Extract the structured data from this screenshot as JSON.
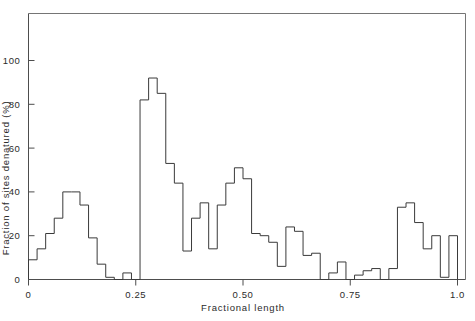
{
  "chart_data": {
    "type": "bar",
    "title": "",
    "subtitle": "",
    "xlabel": "Fractional  length",
    "ylabel": "Fraction of sites denatured (%)",
    "xlim": [
      0,
      1.0
    ],
    "ylim": [
      0,
      122
    ],
    "grid": false,
    "legend": null,
    "bin_width": 0.02,
    "xticks": [
      {
        "value": 0,
        "label": "0"
      },
      {
        "value": 0.25,
        "label": "0.25"
      },
      {
        "value": 0.5,
        "label": "0.50"
      },
      {
        "value": 0.75,
        "label": "0.75"
      },
      {
        "value": 1.0,
        "label": "1.0"
      }
    ],
    "yticks": [
      {
        "value": 0,
        "label": "0"
      },
      {
        "value": 20,
        "label": "20"
      },
      {
        "value": 40,
        "label": "40"
      },
      {
        "value": 60,
        "label": "60"
      },
      {
        "value": 80,
        "label": "80"
      },
      {
        "value": 100,
        "label": "100"
      }
    ],
    "bin_starts": [
      0.0,
      0.02,
      0.04,
      0.06,
      0.08,
      0.1,
      0.12,
      0.14,
      0.16,
      0.18,
      0.2,
      0.22,
      0.24,
      0.26,
      0.28,
      0.3,
      0.32,
      0.34,
      0.36,
      0.38,
      0.4,
      0.42,
      0.44,
      0.46,
      0.48,
      0.5,
      0.52,
      0.54,
      0.56,
      0.58,
      0.6,
      0.62,
      0.64,
      0.66,
      0.68,
      0.7,
      0.72,
      0.74,
      0.76,
      0.78,
      0.8,
      0.82,
      0.84,
      0.86,
      0.88,
      0.9,
      0.92,
      0.94,
      0.96,
      0.98
    ],
    "values": [
      9,
      14,
      21,
      28,
      40,
      40,
      34,
      19,
      7,
      1,
      0,
      3,
      0,
      82,
      92,
      85,
      53,
      44,
      13,
      28,
      35,
      14,
      34,
      44,
      51,
      46,
      21,
      20,
      17,
      6,
      24,
      22,
      11,
      12,
      0,
      3,
      8,
      0,
      2,
      4,
      5,
      0,
      5,
      33,
      35,
      26,
      14,
      20,
      1,
      20
    ],
    "categories": [
      "0.00-0.02",
      "0.02-0.04",
      "0.04-0.06",
      "0.06-0.08",
      "0.08-0.10",
      "0.10-0.12",
      "0.12-0.14",
      "0.14-0.16",
      "0.16-0.18",
      "0.18-0.20",
      "0.20-0.22",
      "0.22-0.24",
      "0.24-0.26",
      "0.26-0.28",
      "0.28-0.30",
      "0.30-0.32",
      "0.32-0.34",
      "0.34-0.36",
      "0.36-0.38",
      "0.38-0.40",
      "0.40-0.42",
      "0.42-0.44",
      "0.44-0.46",
      "0.46-0.48",
      "0.48-0.50",
      "0.50-0.52",
      "0.52-0.54",
      "0.54-0.56",
      "0.56-0.58",
      "0.58-0.60",
      "0.60-0.62",
      "0.62-0.64",
      "0.64-0.66",
      "0.66-0.68",
      "0.68-0.70",
      "0.70-0.72",
      "0.72-0.74",
      "0.74-0.76",
      "0.76-0.78",
      "0.78-0.80",
      "0.80-0.82",
      "0.82-0.84",
      "0.84-0.86",
      "0.86-0.88",
      "0.88-0.90",
      "0.90-0.92",
      "0.92-0.94",
      "0.94-0.96",
      "0.96-0.98",
      "0.98-1.00"
    ]
  },
  "colors": {
    "line": "#3a3a3a",
    "axis": "#4d4d4d",
    "frame": "#757575",
    "text": "#2b2b2b",
    "background": "#ffffff"
  }
}
